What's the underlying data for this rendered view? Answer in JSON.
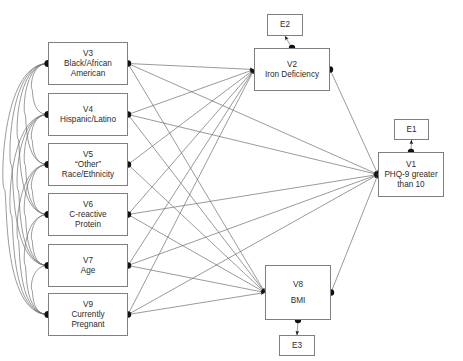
{
  "diagram": {
    "type": "path-diagram",
    "stroke_color": "#6f6f6f",
    "node_border_color": "#7f7f7f",
    "marker_color": "#111111",
    "background": "#ffffff",
    "nodes": [
      {
        "id": "V3",
        "kind": "observed",
        "label_lines": [
          "V3",
          "Black/African",
          "American"
        ],
        "x": 48,
        "y": 42,
        "w": 80,
        "h": 43
      },
      {
        "id": "V4",
        "kind": "observed",
        "label_lines": [
          "V4",
          "Hispanic/Latino"
        ],
        "x": 48,
        "y": 93,
        "w": 80,
        "h": 43
      },
      {
        "id": "V5",
        "kind": "observed",
        "label_lines": [
          "V5",
          "“Other”",
          "Race/Ethnicity"
        ],
        "x": 48,
        "y": 143,
        "w": 80,
        "h": 43
      },
      {
        "id": "V6",
        "kind": "observed",
        "label_lines": [
          "V6",
          "C-reactive",
          "Protein"
        ],
        "x": 48,
        "y": 193,
        "w": 80,
        "h": 43
      },
      {
        "id": "V7",
        "kind": "observed",
        "label_lines": [
          "V7",
          "Age"
        ],
        "x": 48,
        "y": 244,
        "w": 80,
        "h": 43
      },
      {
        "id": "V9",
        "kind": "observed",
        "label_lines": [
          "V9",
          "Currently",
          "Pregnant"
        ],
        "x": 48,
        "y": 293,
        "w": 80,
        "h": 43
      },
      {
        "id": "V2",
        "kind": "observed",
        "label_lines": [
          "V2",
          "Iron Deficiency"
        ],
        "x": 254,
        "y": 48,
        "w": 76,
        "h": 43
      },
      {
        "id": "V8",
        "kind": "observed",
        "label_lines": [
          "V8",
          "BMI"
        ],
        "x": 265,
        "y": 265,
        "w": 66,
        "h": 55
      },
      {
        "id": "V1",
        "kind": "observed",
        "label_lines": [
          "V1",
          "PHQ-9 greater",
          "than 10"
        ],
        "x": 378,
        "y": 152,
        "w": 66,
        "h": 45
      },
      {
        "id": "E2",
        "kind": "error",
        "label_lines": [
          "E2"
        ],
        "x": 267,
        "y": 14,
        "w": 36,
        "h": 22
      },
      {
        "id": "E1",
        "kind": "error",
        "label_lines": [
          "E1"
        ],
        "x": 394,
        "y": 119,
        "w": 35,
        "h": 21
      },
      {
        "id": "E3",
        "kind": "error",
        "label_lines": [
          "E3"
        ],
        "x": 279,
        "y": 335,
        "w": 36,
        "h": 21
      }
    ],
    "directed_edges": [
      {
        "from": "V3",
        "to": "V2"
      },
      {
        "from": "V4",
        "to": "V2"
      },
      {
        "from": "V5",
        "to": "V2"
      },
      {
        "from": "V6",
        "to": "V2"
      },
      {
        "from": "V7",
        "to": "V2"
      },
      {
        "from": "V9",
        "to": "V2"
      },
      {
        "from": "V3",
        "to": "V8"
      },
      {
        "from": "V4",
        "to": "V8"
      },
      {
        "from": "V5",
        "to": "V8"
      },
      {
        "from": "V6",
        "to": "V8"
      },
      {
        "from": "V7",
        "to": "V8"
      },
      {
        "from": "V9",
        "to": "V8"
      },
      {
        "from": "V3",
        "to": "V1"
      },
      {
        "from": "V4",
        "to": "V1"
      },
      {
        "from": "V6",
        "to": "V1"
      },
      {
        "from": "V7",
        "to": "V1"
      },
      {
        "from": "V9",
        "to": "V1"
      },
      {
        "from": "V2",
        "to": "V1"
      },
      {
        "from": "V8",
        "to": "V1"
      },
      {
        "from": "V2",
        "to": "E2"
      },
      {
        "from": "V1",
        "to": "E1"
      },
      {
        "from": "V8",
        "to": "E3"
      }
    ],
    "covariance_arcs": [
      {
        "a": "V3",
        "b": "V4"
      },
      {
        "a": "V3",
        "b": "V5"
      },
      {
        "a": "V3",
        "b": "V6"
      },
      {
        "a": "V3",
        "b": "V7"
      },
      {
        "a": "V3",
        "b": "V9"
      },
      {
        "a": "V4",
        "b": "V5"
      },
      {
        "a": "V4",
        "b": "V6"
      },
      {
        "a": "V4",
        "b": "V7"
      },
      {
        "a": "V4",
        "b": "V9"
      },
      {
        "a": "V5",
        "b": "V6"
      },
      {
        "a": "V5",
        "b": "V7"
      },
      {
        "a": "V5",
        "b": "V9"
      },
      {
        "a": "V6",
        "b": "V7"
      },
      {
        "a": "V6",
        "b": "V9"
      },
      {
        "a": "V7",
        "b": "V9"
      }
    ]
  }
}
